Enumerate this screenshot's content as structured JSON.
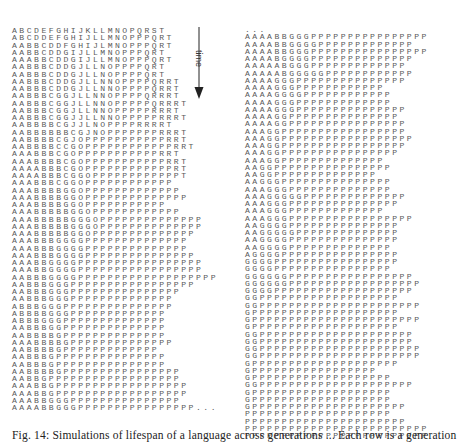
{
  "figure": {
    "time_label": "time",
    "caption": "Fig. 14: Simulations of lifespan of a language across generations ... Each row is a generation",
    "left_column": {
      "rows": [
        "ABCDEFGHIJKLLMNOPQRST",
        "ABCDDEFGHIJLLMNOPPPQRT",
        "AABBCDDFGHIJLMNOPPPQRT",
        "AABBCDDGIJLLMNOPPPQRT",
        "AAABBCDDGIJLLMNOPPPQRT",
        "AABBBCDDGJLLNOPPPPQRT",
        "AABBBCDDGJLLNOPPPPQRT",
        "AABBBCDDGJLLNNOPPPPQRRT",
        "AABBBCDDGJLLNNOPPPPQRRT",
        "AABBBCGGJLLNNOPPPPQRRRT",
        "AABBBCGGJLLNNOPPPPPQRRRT",
        "AABBBCGGJLLNNOPPPPPRRRT",
        "AABBBCGGJJLLNNOPPPPPRRRT",
        "AABBBBCGJJLNOPPPPRRRRT",
        "AABBBBBBCGJNOPPPPPPPRRRT",
        "AABBBBCGJOPPPPPPPPPPPRRT",
        "AABBBBCCGOPPPPPPPPPPPPRRT",
        "AAABBBCGOPPPPPPPPPPPRRT",
        "AAABBBBCGOPPPPPPPPPPPRRT",
        "AAAABBBCGOPPPPPPPPPPPPRT",
        "AAAABBBCGGOPPPPPPPPPPPPT",
        "AAABBBCGGOPPPPPPPPPPPP",
        "AAABBBBGGOPPPPPPPPPPPPP",
        "AAABBBBGGOPPPPPPPPPPPPPP",
        "AAABBBBGGOPPPPPPPPPPP",
        "AAABBBBBGGOPPPPPPPPPPPP",
        "AAABBBBBGGGOPPPPPPPPPPPPPP",
        "AAABBBBBGGGOPPPPPPPPPPPPPP",
        "AAABBBBBGGOPPPPPPPPPPPPPP",
        "AAABBBGGGGPPPPPPPPPPPPPP",
        "AAABBBGGGGPPPPPPPPPPPPPP",
        "AAABBBGGGGPPPPPPPPPPPPPPP",
        "AAABBGGGGPPPPPPPPPPPPPPPPP",
        "AAABBGGGGPPPPPPPPPPPPPPPPP",
        "AABBBGGGGPPPPPPPPPPPPPPPPPPP",
        "AABBBGGGPPPPPPPPPPPPPPPPP",
        "AABBBGGGPPPPPPPPPPPPPPP",
        "AABBBGGGPPPPPPPPPPPPPP",
        "ABBBGGGPPPPPPPPPPPPPPP",
        "ABBBBGGGPPPPPPPPPPPPP",
        "ABBBGGGPPPPPPPPPPPPPP",
        "AABBBGGPPPPPPPPPPPPPP",
        "AABBBBGPPPPPPPPPPPPPP",
        "AAABBBBGPPPPPPPPPPPPPP",
        "AABBBBGPPPPPPPPPPPPP",
        "AABBBGPPPPPPPPPPPPPPP",
        "AABBBGPPPPPPPPPPPPPPP",
        "AABBBBGPPPPPPPPPPPPPPPP",
        "AABBGPPPPPPPPPPPPPPPPPP",
        "AAABBGPPPPPPPPPPPPPPPPPP",
        "AAABBGPPPPPPPPPPPPPPPPPP",
        "AAABBGGGPPPPPPPPPPPPPPP",
        "AAAABBGGGPPPPPPPPPPPPPPPP..."
      ]
    },
    "right_column": {
      "leading": "...",
      "rows": [
        "AAAABBGGGPPPPPPPPPPPPPPPP",
        "AAAABBGGGGPPPPPPPPPPPPP",
        "AAAABBGGGPPPPPPPPPPPPPPPP",
        "AAAABGGGGPPPPPPPPPPPPPP",
        "AAAAABGGGPPPPPPPPPPPPP",
        "AAAAABGGGGGPPPPPPPPPPPP",
        "AAAAGGGPPPPPPPPPPPPPPP",
        "AAAAGGGPPPPPPPPPPPP",
        "AAAAGGGGPPPPPPPPPPPP",
        "AAAAGGGPPPPPPPPPPPPP",
        "AAAAGGGPPPPPPPPPPPPPPP",
        "AAAAGGPPPPPPPPPPPPPPP",
        "AAAAGGPPPPPPPPPPPPPPPP",
        "AAAGGPPPPPPPPPPPPPPPPP",
        "AAAGGPPPPPPPPPPPPPPPPPP",
        "AAAGGPPPPPPPPPPPPPPPPP",
        "AAAGGPPPPPPPPPPPPPPPP",
        "AAAGGPPPPPPPPPPPPPP",
        "AAGGPPPPPPPPPPPPPPPP",
        "AAGGPPPPPPPPPPPPPP",
        "AAGGGPPPPPPPPPPPPPPP",
        "AAAGGGPPPPPPPPPPPPPP",
        "AAAGGGGGPPPPPPPPPPPPPP",
        "AAAGGGPPPPPPPPPPPPPPP",
        "AAAGGGPPPPPPPPPPPPP",
        "AAAGGGPPPPPPPPPPPPPPPPP",
        "AAGGGGPPPPPPPPPPPPPPP",
        "AAGGGGGPPPPPPPPPPPPPP",
        "AAGGGGPPPPPPPPPPPPPPP",
        "AAGGGGPPPPPPPPPPPPPP",
        "AGGGGPPPPPPPPPPPPPPPP",
        "GGGGPPPPPPPPPPPPPPPPP",
        "GGGGPPPPPPPPPPPPPPPP",
        "GGGGGGPPPPPPPPPPPPPPPPP",
        "GGGGGGPPPPPPPPPPPPPPPPPP",
        "GGGGPPPPPPPPPPPPPPPPPPP",
        "GGPPPPPPPPPPPPPPPPPPP",
        "GGPPPPPPPPPPPPPPPPPPPPPP",
        "GPPPPPPPPPPPPPPPPPPPP",
        "GPPPPPPPPPPPPPPPPPPPPPPP",
        "GPPPPPPPPPPPPPPPPPPPP",
        "GGPPPPPPPPPPPPPPPPPPPPP",
        "GGPPPPPPPPPPPPPPPPPPPPP",
        "GGPPPPPPPPPPPPPPPPPPPPPP",
        "GGPPPPPPPPPPPPPPPPPPPPPP",
        "GPPPPPPPPPPPPPPPPPPPP",
        "GPPPPPPPPPPPPPPPPP",
        "GPPPPPPPPPPPPPPPPPPP",
        "GGPPPPPPPPPPPPPPPPPPPPP",
        "GPPPPPPPPPPPPPPPPPPP",
        "GPPPPPPPPPPPPPPPPPPP",
        "GPPPPPPPPPPPPPPPPPPPPP",
        "PPPPPPPPPPPPPPPPPPPP",
        "PPPPPPPPPPPPPPPPPPPPPP",
        "PPPPPPPPPPPPPPPPPPPPPPPPP",
        "PPPPPPPPPPPPPPPPPPPPPPPPP"
      ]
    }
  }
}
